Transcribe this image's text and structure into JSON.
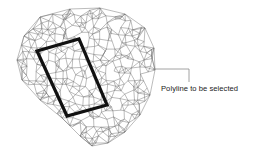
{
  "diagram": {
    "annotation": {
      "label": "Polyline to be selected"
    },
    "mesh": {
      "type": "triangulated-irregular-network",
      "stroke_color": "#6a6a6a"
    },
    "polyline": {
      "shape": "rotated-rectangle",
      "stroke_color": "#111111"
    },
    "leader_color": "#8a8a8a"
  }
}
